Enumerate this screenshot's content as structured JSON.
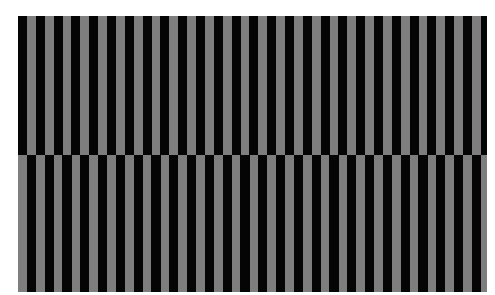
{
  "figure": {
    "colors": {
      "dark": "#050505",
      "light": "#7e7e7e",
      "background": "#ffffff"
    },
    "stripe_period_px": 17.8,
    "dark_width_px": 9,
    "light_width_px": 8.8,
    "bands": [
      {
        "name": "top",
        "phase_offset_px": 0
      },
      {
        "name": "bottom",
        "phase_offset_px": 8.9
      }
    ]
  }
}
